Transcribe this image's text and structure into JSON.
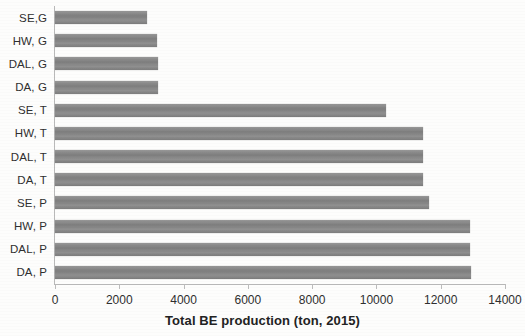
{
  "chart_data": {
    "type": "bar",
    "orientation": "horizontal",
    "title": "",
    "xlabel": "Total BE production (ton, 2015)",
    "ylabel": "",
    "xlim": [
      0,
      14000
    ],
    "xticks": [
      0,
      2000,
      4000,
      6000,
      8000,
      10000,
      12000,
      14000
    ],
    "xtick_labels": [
      "0",
      "2000",
      "4000",
      "6000",
      "8000",
      "10000",
      "12000",
      "14000"
    ],
    "grid": false,
    "legend": null,
    "bar_color": "#838383",
    "categories": [
      "SE,G",
      "HW, G",
      "DAL, G",
      "DA, G",
      "SE, T",
      "HW, T",
      "DAL, T",
      "DA, T",
      "SE, P",
      "HW, P",
      "DAL, P",
      "DA, P"
    ],
    "values": [
      2870,
      3180,
      3200,
      3200,
      10300,
      11450,
      11450,
      11450,
      11640,
      12900,
      12900,
      12950
    ]
  }
}
